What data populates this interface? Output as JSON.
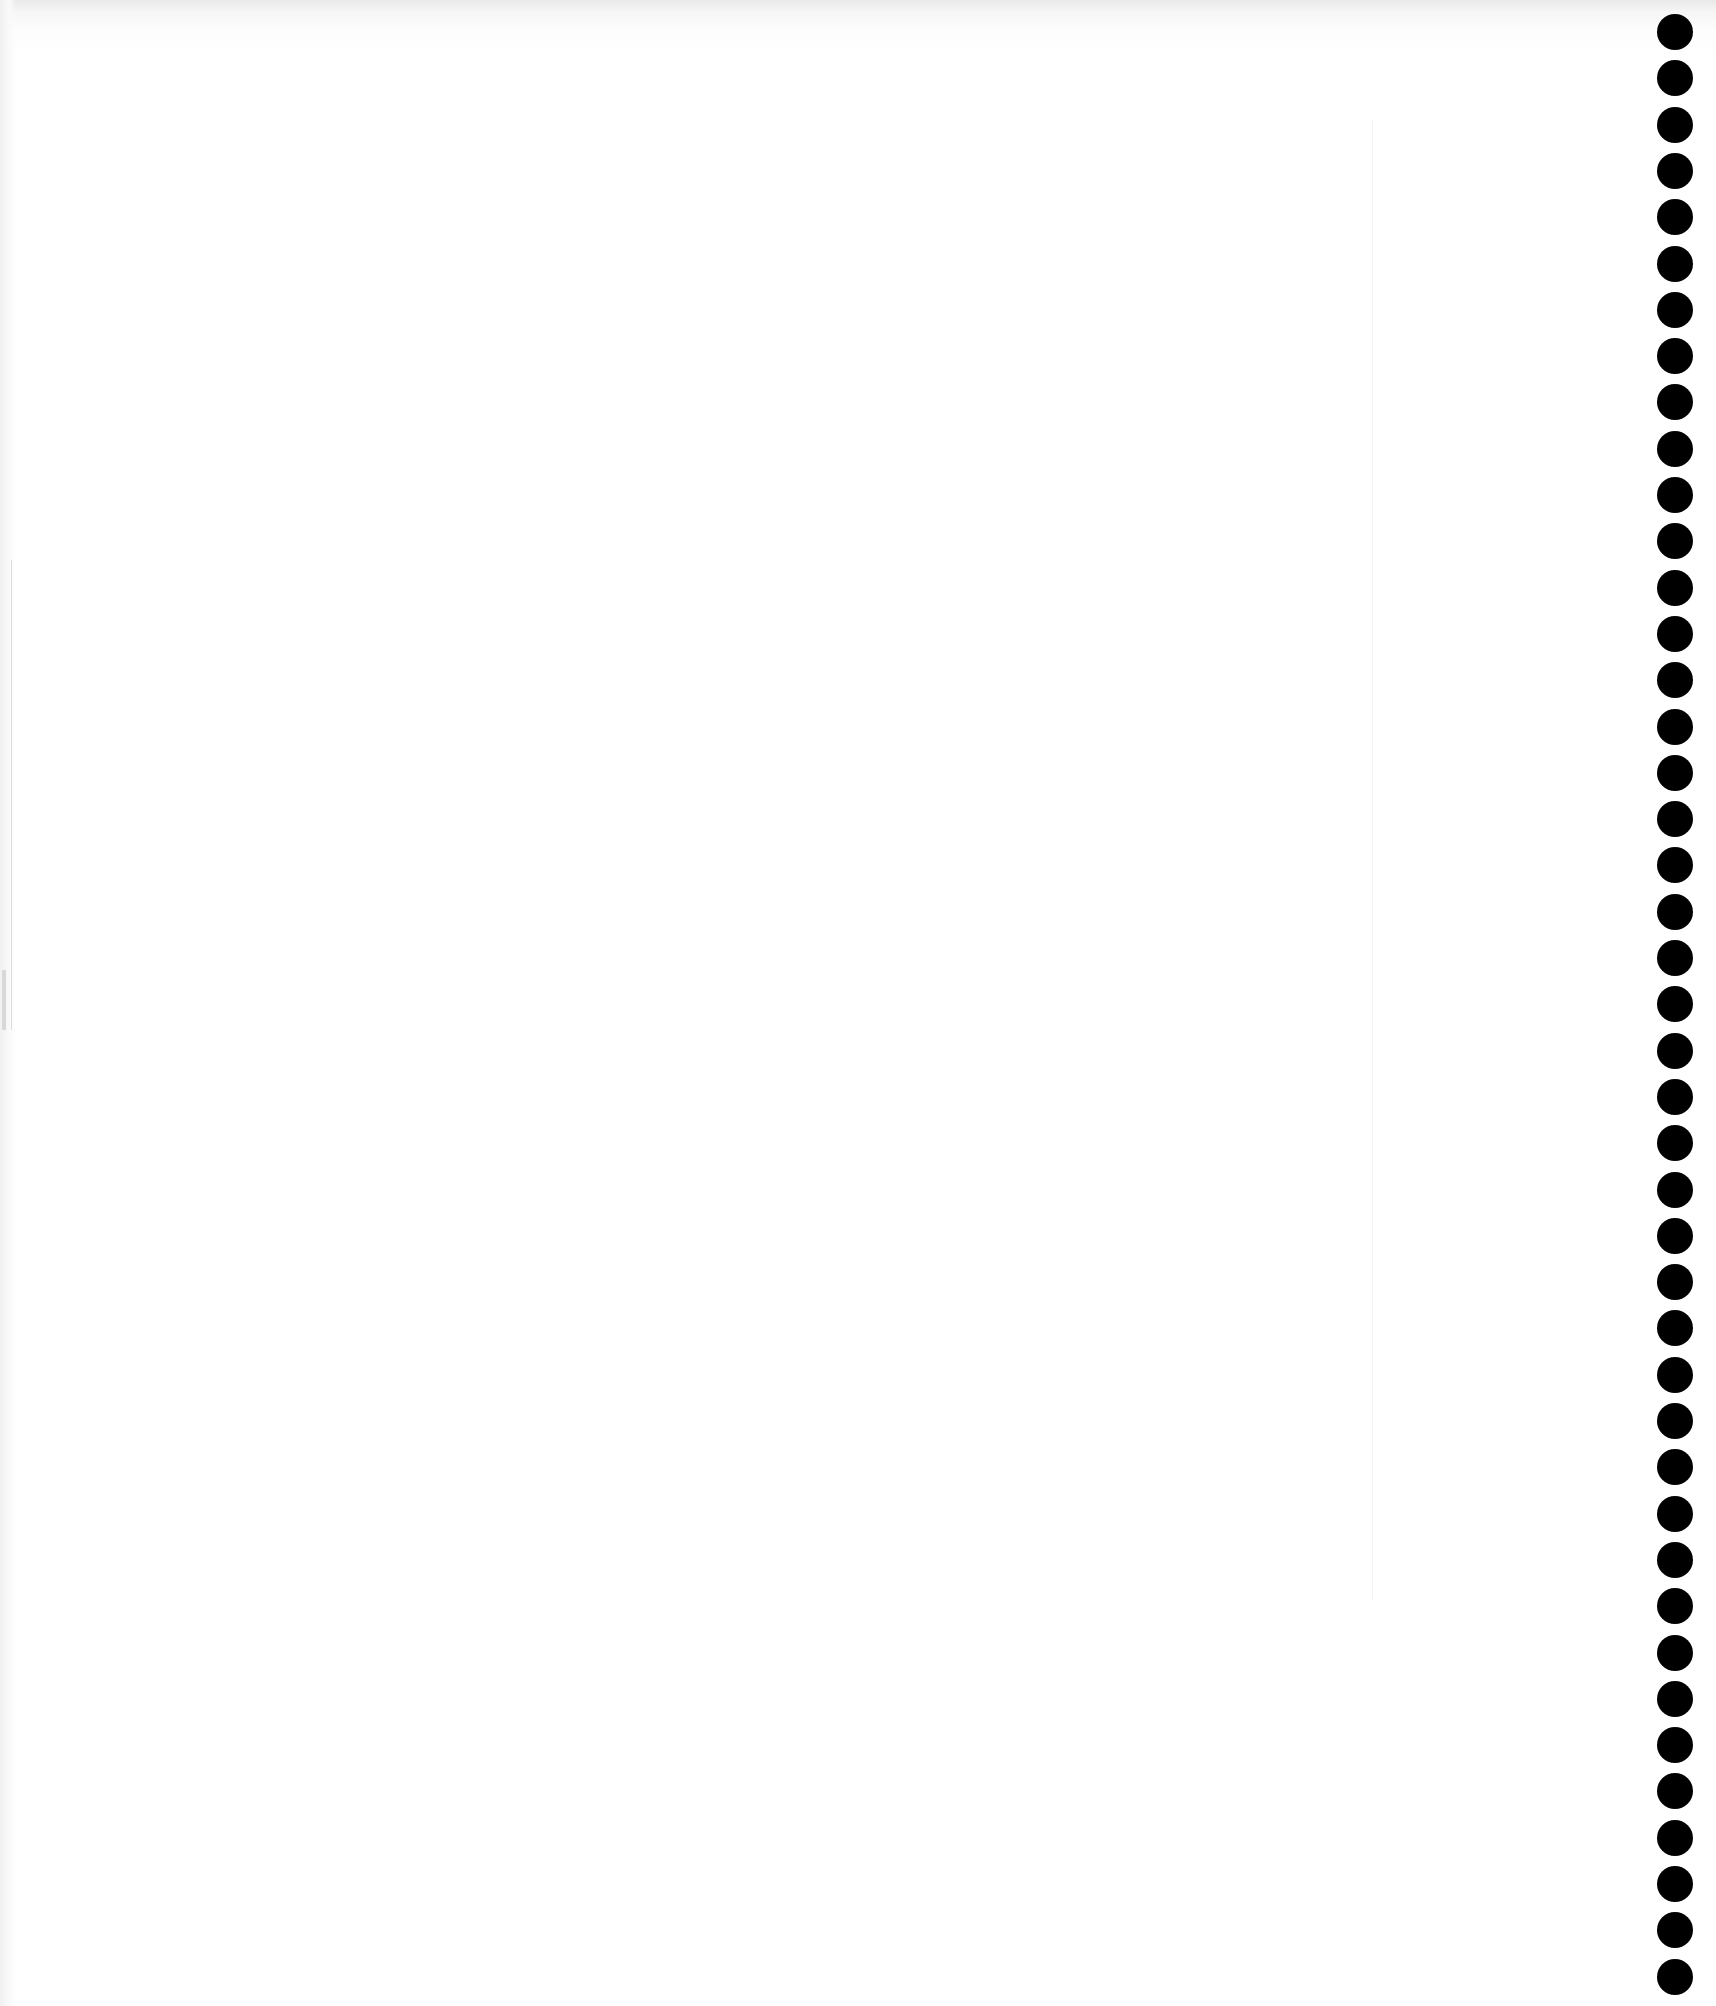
{
  "document": {
    "type": "scanned-blank-page",
    "background_color": "#ffffff",
    "ghost_header_text": "",
    "ghost_title_text": "",
    "binding": {
      "side": "right",
      "hole_count": 43,
      "hole_color": "#000000",
      "hole_diameter_px": 36,
      "hole_spacing_px": 46.3
    }
  }
}
